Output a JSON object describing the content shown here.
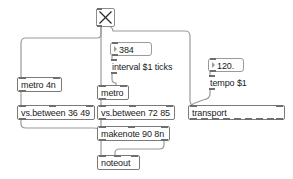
{
  "patcher": {
    "title": "max-patcher-canvas",
    "width": 293,
    "height": 179,
    "background_color": "#ffffff",
    "cable_color": "#9a9a9a",
    "box_border_color": "#8d8d8d",
    "text_color": "#1a1a1a"
  },
  "objects": {
    "toggle": {
      "label": "X",
      "name": "toggle-object"
    },
    "number_interval": {
      "value": "384",
      "name": "number-box-interval"
    },
    "msg_interval": {
      "text": "interval $1 ticks",
      "name": "message-box-interval"
    },
    "number_tempo": {
      "value": "120.",
      "name": "number-box-tempo"
    },
    "msg_tempo": {
      "text": "tempo $1",
      "name": "message-box-tempo"
    },
    "metro_4n": {
      "text": "metro 4n",
      "name": "object-metro-4n"
    },
    "metro": {
      "text": "metro",
      "name": "object-metro"
    },
    "vs_between_low": {
      "text": "vs.between 36 49",
      "name": "object-vs-between-low"
    },
    "vs_between_high": {
      "text": "vs.between 72 85",
      "name": "object-vs-between-high"
    },
    "makenote": {
      "text": "makenote 90 8n",
      "name": "object-makenote"
    },
    "noteout": {
      "text": "noteout",
      "name": "object-noteout"
    },
    "transport": {
      "text": "transport",
      "name": "object-transport"
    }
  }
}
